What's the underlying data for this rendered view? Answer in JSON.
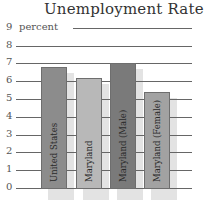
{
  "chart_data": {
    "type": "bar",
    "title": "Unemployment Rate",
    "xlabel": "",
    "ylabel": "percent",
    "ylim": [
      0,
      9
    ],
    "yticks": [
      0,
      1,
      2,
      3,
      4,
      5,
      6,
      7,
      8,
      9
    ],
    "grid": true,
    "categories": [
      "United States",
      "Maryland",
      "Maryland (Male)",
      "Maryland (Female)"
    ],
    "values": [
      6.8,
      6.2,
      7.0,
      5.4
    ],
    "colors": [
      "#8c8c8c",
      "#b8b8b8",
      "#7a7a7a",
      "#a2a2a2"
    ]
  },
  "labels": {
    "title": "Unemployment Rate",
    "unit": "percent",
    "ticks": [
      "0",
      "1",
      "2",
      "3",
      "4",
      "5",
      "6",
      "7",
      "8",
      "9"
    ],
    "bars": [
      "United States",
      "Maryland",
      "Maryland (Male)",
      "Maryland (Female)"
    ]
  }
}
